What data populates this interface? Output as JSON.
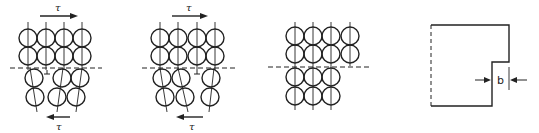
{
  "figure": {
    "panels": [
      {
        "id": "a",
        "description": "Edge dislocation in bubble raft under shear stress",
        "shear_top_label": "τ",
        "shear_bottom_label": "τ",
        "dislocation_symbol": "⊥"
      },
      {
        "id": "b",
        "description": "Dislocation moved one step under shear",
        "shear_top_label": "τ",
        "shear_bottom_label": "τ",
        "dislocation_symbol": "⊥"
      },
      {
        "id": "c",
        "description": "Dislocation passed through, crystal slipped by one spacing"
      },
      {
        "id": "d",
        "description": "Resulting step on crystal surface",
        "step_label": "b"
      }
    ],
    "colors": {
      "line": "#222222",
      "background": "#ffffff"
    }
  }
}
